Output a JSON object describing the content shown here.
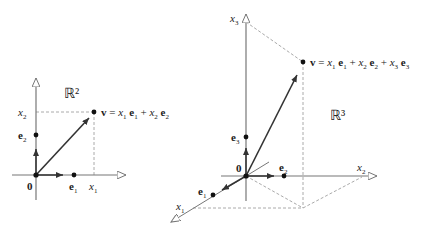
{
  "left": {
    "space_label": "ℝ²",
    "axis_x_label": "x",
    "axis_x_sub": "1",
    "axis_y_label": "x",
    "axis_y_sub": "2",
    "origin_label": "0",
    "e1_label": "e",
    "e1_sub": "1",
    "e2_label": "e",
    "e2_sub": "2",
    "vector_equation": [
      "v = x",
      "1",
      " e",
      "1",
      " + x",
      "2",
      " e",
      "2"
    ]
  },
  "right": {
    "space_label": "ℝ³",
    "axis_x1_label": "x",
    "axis_x1_sub": "1",
    "axis_x2_label": "x",
    "axis_x2_sub": "2",
    "axis_x3_label": "x",
    "axis_x3_sub": "3",
    "origin_label": "0",
    "e1_label": "e",
    "e1_sub": "1",
    "e2_label": "e",
    "e2_sub": "2",
    "e3_label": "e",
    "e3_sub": "3",
    "vector_equation": [
      "v = x",
      "1",
      " e",
      "1",
      " + x",
      "2",
      " e",
      "2",
      " + x",
      "3",
      " e",
      "3"
    ]
  },
  "colors": {
    "axis": "#777777",
    "vector": "#333333",
    "dashed": "#aaaaaa",
    "text": "#222222"
  }
}
